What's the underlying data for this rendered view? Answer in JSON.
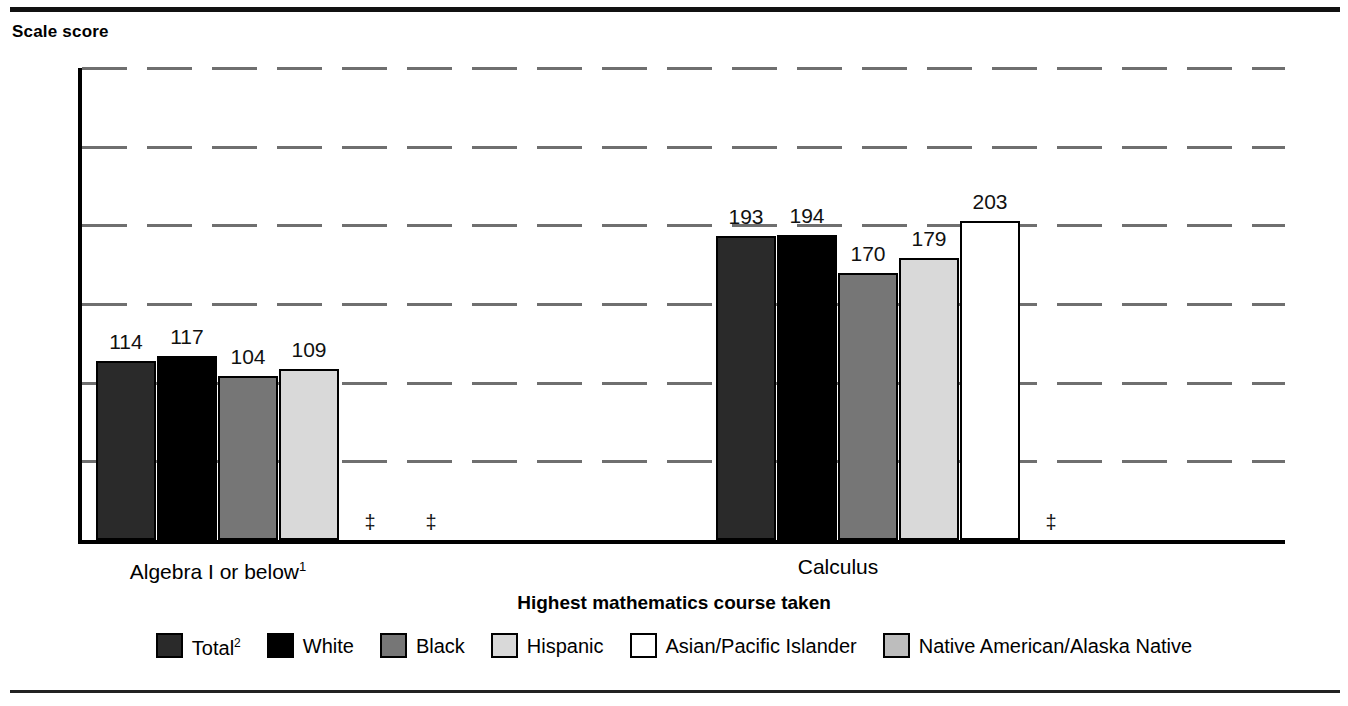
{
  "figure": {
    "y_axis_title": "Scale score",
    "x_axis_title": "Highest mathematics course taken"
  },
  "chart_data": {
    "type": "bar",
    "title": "",
    "xlabel": "Highest mathematics course taken",
    "ylabel": "Scale score",
    "ylim": [
      0,
      300
    ],
    "yticks": [
      0,
      50,
      100,
      150,
      200,
      250,
      300
    ],
    "ytick_labels": [
      "0",
      "50",
      "100",
      "150",
      "200",
      "250",
      "300"
    ],
    "grid": true,
    "legend_position": "bottom",
    "categories": [
      "Algebra I or below¹",
      "Calculus"
    ],
    "category_labels": [
      {
        "text": "Algebra I or below",
        "footnote": "1"
      },
      {
        "text": "Calculus",
        "footnote": ""
      }
    ],
    "series": [
      {
        "name": "Total²",
        "legend_label": "Total",
        "legend_footnote": "2",
        "fill": "fill-total",
        "color": "#2a2a2a",
        "values": [
          114,
          193
        ],
        "labels": [
          "114",
          "193"
        ]
      },
      {
        "name": "White",
        "legend_label": "White",
        "legend_footnote": "",
        "fill": "fill-white",
        "color": "#000000",
        "values": [
          117,
          194
        ],
        "labels": [
          "117",
          "194"
        ]
      },
      {
        "name": "Black",
        "legend_label": "Black",
        "legend_footnote": "",
        "fill": "fill-black",
        "color": "#767676",
        "values": [
          104,
          170
        ],
        "labels": [
          "104",
          "170"
        ]
      },
      {
        "name": "Hispanic",
        "legend_label": "Hispanic",
        "legend_footnote": "",
        "fill": "fill-hispanic",
        "color": "#d9d9d9",
        "values": [
          109,
          179
        ],
        "labels": [
          "109",
          "179"
        ]
      },
      {
        "name": "Asian/Pacific Islander",
        "legend_label": "Asian/Pacific Islander",
        "legend_footnote": "",
        "fill": "fill-asian",
        "color": "#ffffff",
        "values": [
          null,
          203
        ],
        "labels": [
          "‡",
          "203"
        ]
      },
      {
        "name": "Native American/Alaska Native",
        "legend_label": "Native American/Alaska Native",
        "legend_footnote": "",
        "fill": "fill-native",
        "color": "#bdbdbd",
        "values": [
          null,
          null
        ],
        "labels": [
          "‡",
          "‡"
        ]
      }
    ],
    "suppressed_marker": "‡"
  },
  "ticks": [
    {
      "value": 300,
      "label": "300"
    },
    {
      "value": 250,
      "label": "250"
    },
    {
      "value": 200,
      "label": "200"
    },
    {
      "value": 150,
      "label": "150"
    },
    {
      "value": 100,
      "label": "100"
    },
    {
      "value": 50,
      "label": "50"
    },
    {
      "value": 0,
      "label": "0"
    }
  ],
  "groups": [
    {
      "label": "Algebra I or below",
      "footnote": "1",
      "bars": [
        {
          "series": "Total²",
          "fill": "fill-total",
          "value": 114,
          "label": "114",
          "suppressed": false
        },
        {
          "series": "White",
          "fill": "fill-white",
          "value": 117,
          "label": "117",
          "suppressed": false
        },
        {
          "series": "Black",
          "fill": "fill-black",
          "value": 104,
          "label": "104",
          "suppressed": false
        },
        {
          "series": "Hispanic",
          "fill": "fill-hispanic",
          "value": 109,
          "label": "109",
          "suppressed": false
        },
        {
          "series": "Asian/Pacific Islander",
          "fill": "fill-asian",
          "value": null,
          "label": "‡",
          "suppressed": true
        },
        {
          "series": "Native American/Alaska Native",
          "fill": "fill-native",
          "value": null,
          "label": "‡",
          "suppressed": true
        }
      ]
    },
    {
      "label": "Calculus",
      "footnote": "",
      "bars": [
        {
          "series": "Total²",
          "fill": "fill-total",
          "value": 193,
          "label": "193",
          "suppressed": false
        },
        {
          "series": "White",
          "fill": "fill-white",
          "value": 194,
          "label": "194",
          "suppressed": false
        },
        {
          "series": "Black",
          "fill": "fill-black",
          "value": 170,
          "label": "170",
          "suppressed": false
        },
        {
          "series": "Hispanic",
          "fill": "fill-hispanic",
          "value": 179,
          "label": "179",
          "suppressed": false
        },
        {
          "series": "Asian/Pacific Islander",
          "fill": "fill-asian",
          "value": 203,
          "label": "203",
          "suppressed": false
        },
        {
          "series": "Native American/Alaska Native",
          "fill": "fill-native",
          "value": null,
          "label": "‡",
          "suppressed": true
        }
      ]
    }
  ],
  "legend": [
    {
      "label": "Total",
      "footnote": "2",
      "fill": "fill-total"
    },
    {
      "label": "White",
      "footnote": "",
      "fill": "fill-white"
    },
    {
      "label": "Black",
      "footnote": "",
      "fill": "fill-black"
    },
    {
      "label": "Hispanic",
      "footnote": "",
      "fill": "fill-hispanic"
    },
    {
      "label": "Asian/Pacific Islander",
      "footnote": "",
      "fill": "fill-asian"
    },
    {
      "label": "Native American/Alaska Native",
      "footnote": "",
      "fill": "fill-native"
    }
  ]
}
